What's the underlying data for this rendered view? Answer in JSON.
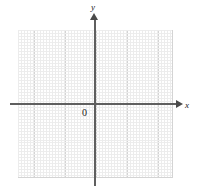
{
  "figure": {
    "type": "coordinate-grid",
    "title": "",
    "background_color": "#ffffff"
  },
  "axes": {
    "x": {
      "label": "x",
      "arrow": "arrow-right",
      "color": "#5f5f5f"
    },
    "y": {
      "label": "y",
      "arrow": "arrow-up",
      "color": "#5f5f5f"
    },
    "origin": {
      "label": "0",
      "color": "#1a1a1a"
    }
  },
  "grid": {
    "major_color": "#d4d4d4",
    "minor_color": "#ececec",
    "major_cells_x": 10,
    "major_cells_y": 10,
    "minor_per_major": 5
  },
  "chart_data": {
    "type": "scatter",
    "title": "",
    "xlabel": "x",
    "ylabel": "y",
    "xlim": [
      -5,
      5
    ],
    "ylim": [
      -5,
      5
    ],
    "xticks": [
      -5,
      -4,
      -3,
      -2,
      -1,
      0,
      1,
      2,
      3,
      4,
      5
    ],
    "yticks": [
      -5,
      -4,
      -3,
      -2,
      -1,
      0,
      1,
      2,
      3,
      4,
      5
    ],
    "xtick_labels": [
      "",
      "",
      "",
      "",
      "",
      "0",
      "",
      "",
      "",
      "",
      ""
    ],
    "ytick_labels": [
      "",
      "",
      "",
      "",
      "",
      "0",
      "",
      "",
      "",
      "",
      ""
    ],
    "grid": true,
    "legend": null,
    "series": [],
    "annotations": [
      {
        "text": "0",
        "x": 0,
        "y": 0,
        "position": "below-left-of-origin"
      },
      {
        "text": "x",
        "x": 5,
        "y": 0,
        "position": "axis-end-right"
      },
      {
        "text": "y",
        "x": 0,
        "y": 5,
        "position": "axis-end-top"
      }
    ]
  }
}
